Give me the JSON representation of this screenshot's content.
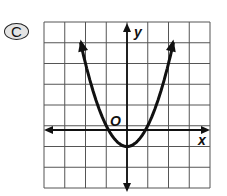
{
  "option_label": "C",
  "chart_data": {
    "type": "line",
    "title": "",
    "xlabel": "x",
    "ylabel": "y",
    "origin_label": "O",
    "equation": "y = x^2 - 1",
    "grid": true,
    "xlim": [
      -4,
      4
    ],
    "ylim": [
      -3,
      5
    ],
    "x": [
      -2.24,
      -2,
      -1.5,
      -1,
      -0.5,
      0,
      0.5,
      1,
      1.5,
      2,
      2.24
    ],
    "series": [
      {
        "name": "parabola",
        "values": [
          4.0,
          3,
          1.25,
          0,
          -0.75,
          -1,
          -0.75,
          0,
          1.25,
          3,
          4.0
        ]
      }
    ],
    "vertex": [
      0,
      -1
    ],
    "x_intercepts": [
      -1,
      1
    ]
  }
}
